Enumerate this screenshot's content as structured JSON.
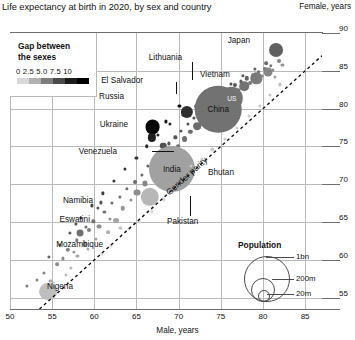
{
  "chart_data": {
    "type": "scatter",
    "title": "Life expectancy at birth in 2020, by sex and country",
    "xlabel": "Male, years",
    "ylabel": "Female, years",
    "xlim": [
      50,
      87
    ],
    "ylim": [
      53.5,
      90
    ],
    "xticks": [
      50,
      55,
      60,
      65,
      70,
      75,
      80,
      85
    ],
    "yticks": [
      55,
      60,
      65,
      70,
      75,
      80,
      85,
      90
    ],
    "grid": true,
    "size_encoding": "population",
    "color_encoding": "gap between the sexes (female minus male, years)",
    "annotations": [
      {
        "text": "Gender parity",
        "type": "diagonal-dashed-line",
        "note": "y = x reference line"
      }
    ],
    "labeled_points": [
      {
        "name": "Japan",
        "male": 81.6,
        "female": 87.7,
        "gap": 6.1,
        "population": 126000000
      },
      {
        "name": "US",
        "male": 76.3,
        "female": 81.4,
        "gap": 5.1,
        "population": 331000000
      },
      {
        "name": "China",
        "male": 74.7,
        "female": 79.9,
        "gap": 5.2,
        "population": 1411000000
      },
      {
        "name": "Lithuania",
        "male": 70.1,
        "female": 80.4,
        "gap": 10.3,
        "population": 2800000
      },
      {
        "name": "Vietnam",
        "male": 71.0,
        "female": 79.6,
        "gap": 8.6,
        "population": 97000000
      },
      {
        "name": "El Salvador",
        "male": 68.5,
        "female": 78.3,
        "gap": 9.8,
        "population": 6500000
      },
      {
        "name": "Russia",
        "male": 66.9,
        "female": 77.6,
        "gap": 10.7,
        "population": 144000000
      },
      {
        "name": "Ukraine",
        "male": 66.8,
        "female": 76.2,
        "gap": 9.4,
        "population": 44000000
      },
      {
        "name": "Venezuela",
        "male": 68.2,
        "female": 75.1,
        "gap": 6.9,
        "population": 28000000
      },
      {
        "name": "India",
        "male": 69.2,
        "female": 72.0,
        "gap": 2.8,
        "population": 1380000000
      },
      {
        "name": "Bhutan",
        "male": 71.5,
        "female": 72.4,
        "gap": 0.9,
        "population": 770000
      },
      {
        "name": "Pakistan",
        "male": 66.6,
        "female": 68.3,
        "gap": 1.7,
        "population": 220000000
      },
      {
        "name": "Namibia",
        "male": 60.8,
        "female": 67.6,
        "gap": 6.8,
        "population": 2500000
      },
      {
        "name": "Eswatini",
        "male": 57.8,
        "female": 64.8,
        "gap": 7.0,
        "population": 1200000
      },
      {
        "name": "Mozambique",
        "male": 58.3,
        "female": 63.6,
        "gap": 5.3,
        "population": 31000000
      },
      {
        "name": "Nigeria",
        "male": 54.5,
        "female": 55.8,
        "gap": 1.3,
        "population": 206000000
      }
    ]
  },
  "gap_legend": {
    "title_line1": "Gap between",
    "title_line2": "the sexes",
    "tick_labels": [
      "0",
      "2.5",
      "5.0",
      "7.5",
      "10"
    ],
    "ramp_colors": [
      "#d8d8d8",
      "#b0b0b0",
      "#7d7d7d",
      "#4a4a4a",
      "#1c1c1c",
      "#000000"
    ]
  },
  "population_legend": {
    "title": "Population",
    "items": [
      {
        "label": "1bn"
      },
      {
        "label": "200m"
      },
      {
        "label": "20m"
      }
    ]
  },
  "axes": {
    "x_tick_labels": [
      "50",
      "55",
      "60",
      "65",
      "70",
      "75",
      "80",
      "85"
    ],
    "y_tick_labels": [
      "90",
      "85",
      "80",
      "75",
      "70",
      "65",
      "60",
      "55"
    ]
  }
}
